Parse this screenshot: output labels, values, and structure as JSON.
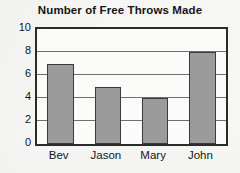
{
  "chart_data": {
    "type": "bar",
    "title": "Number of Free Throws Made",
    "xlabel": "",
    "ylabel": "",
    "categories": [
      "Bev",
      "Jason",
      "Mary",
      "John"
    ],
    "values": [
      7,
      5,
      4,
      8
    ],
    "ylim": [
      0,
      10
    ],
    "yticks": [
      0,
      2,
      4,
      6,
      8,
      10
    ],
    "ytick_labels": [
      "0",
      "2",
      "4",
      "6",
      "8",
      "10"
    ],
    "gridlines": [
      2,
      4,
      6,
      8
    ],
    "grid": true,
    "legend": null,
    "legend_position": "none",
    "series": [
      {
        "name": "Free Throws Made",
        "values": [
          7,
          5,
          4,
          8
        ]
      }
    ]
  },
  "style": {
    "bar_fill": "#9b9b9b",
    "bar_edge": "#3a3a3a",
    "frame_color": "#2b2b2b",
    "grid_color": "#6f6f6f",
    "text_color": "#151515",
    "background": "#f6f6f5",
    "plot_background": "#fbfbfa"
  }
}
